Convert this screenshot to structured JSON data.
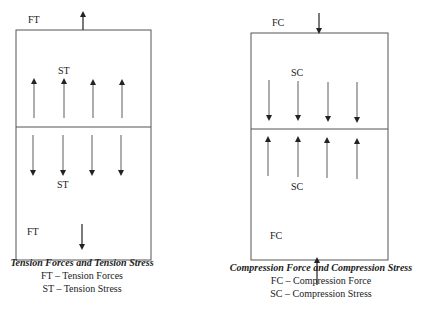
{
  "tension": {
    "force_label_top": "FT",
    "stress_label_top": "ST",
    "stress_label_bottom": "ST",
    "force_label_bottom": "FT",
    "caption_title": "Tension Forces and Tension Stress",
    "legend": [
      "FT – Tension Forces",
      "ST – Tension Stress"
    ]
  },
  "compression": {
    "force_label_top": "FC",
    "stress_label_top": "SC",
    "stress_label_bottom": "SC",
    "force_label_bottom": "FC",
    "caption_title": "Compression Force and Compression Stress",
    "legend": [
      "FC – Compression Force",
      "SC – Compression Stress"
    ]
  },
  "colors": {
    "line": "#333333",
    "box": "#555555"
  }
}
